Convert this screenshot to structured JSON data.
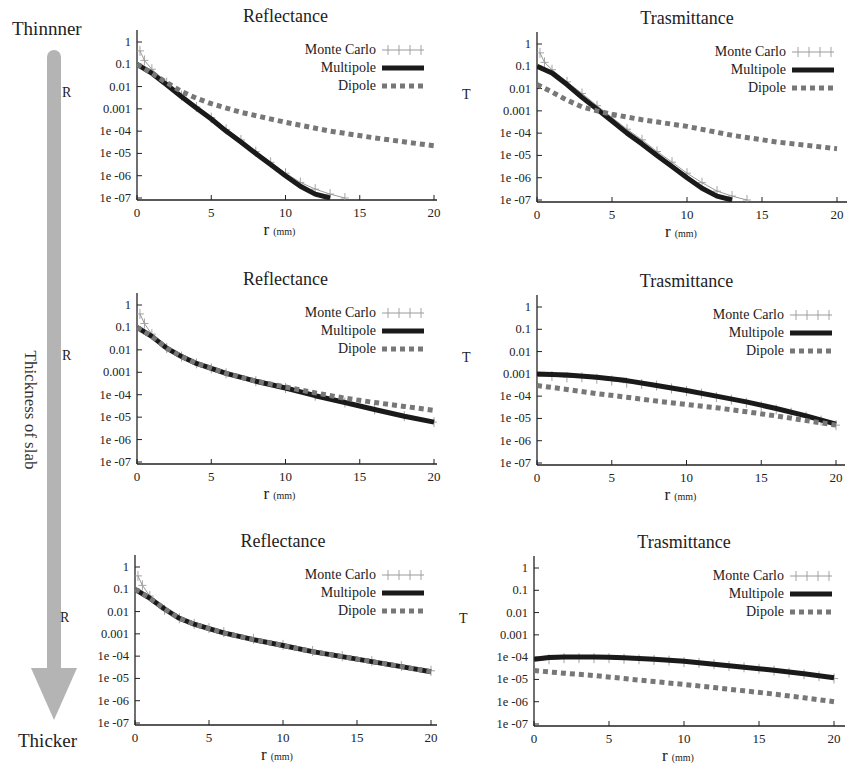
{
  "side_labels": {
    "top": "Thinnner",
    "middle": "Thickness of slab",
    "bottom": "Thicker"
  },
  "colors": {
    "monte_carlo": "#9a9a9a",
    "multipole": "#1a1a1a",
    "dipole": "#777777",
    "arrow": "#b4b4b4",
    "axis": "#222222"
  },
  "chart_data": [
    {
      "id": "r1-reflectance",
      "row": 1,
      "type": "line",
      "title": "Reflectance",
      "ylabel": "R",
      "xlabel": "r",
      "xlabel_unit": "(mm)",
      "xlim": [
        0,
        20
      ],
      "ylim": [
        1e-07,
        1
      ],
      "yscale": "log",
      "xticks": [
        "0",
        "5",
        "10",
        "15",
        "20"
      ],
      "yticks": [
        "1",
        "0.1",
        "0.01",
        "0.001",
        "1e -04",
        "1e -05",
        "1e -06",
        "1e -07"
      ],
      "legend": [
        "Monte Carlo",
        "Multipole",
        "Dipole"
      ],
      "legend_position": "upper right",
      "series": [
        {
          "name": "Monte Carlo",
          "x": [
            0.2,
            0.5,
            1,
            2,
            3,
            4,
            5,
            6,
            7,
            8,
            9,
            10,
            11,
            12,
            13,
            14
          ],
          "y": [
            0.4,
            0.15,
            0.06,
            0.015,
            0.004,
            0.0012,
            0.0004,
            0.00012,
            4e-05,
            1.2e-05,
            4e-06,
            1.3e-06,
            5e-07,
            2.5e-07,
            1.5e-07,
            1e-07
          ]
        },
        {
          "name": "Multipole",
          "x": [
            0,
            1,
            2,
            3,
            4,
            5,
            6,
            7,
            8,
            9,
            10,
            11,
            12,
            13
          ],
          "y": [
            0.1,
            0.04,
            0.012,
            0.0035,
            0.0011,
            0.00035,
            0.0001,
            3.3e-05,
            1e-05,
            3.2e-06,
            1e-06,
            3.4e-07,
            1.5e-07,
            1e-07
          ]
        },
        {
          "name": "Dipole",
          "x": [
            0,
            1,
            2,
            3,
            4,
            5,
            7,
            10,
            13,
            16,
            20
          ],
          "y": [
            0.1,
            0.04,
            0.015,
            0.006,
            0.003,
            0.0017,
            0.0007,
            0.00025,
            0.0001,
            5e-05,
            2.2e-05
          ]
        }
      ]
    },
    {
      "id": "r1-trasmittance",
      "row": 1,
      "type": "line",
      "title": "Trasmittance",
      "ylabel": "T",
      "xlabel": "r",
      "xlabel_unit": "(mm)",
      "xlim": [
        0,
        20
      ],
      "ylim": [
        1e-07,
        1
      ],
      "yscale": "log",
      "xticks": [
        "0",
        "5",
        "10",
        "15",
        "20"
      ],
      "yticks": [
        "1",
        "0.1",
        "0.01",
        "0.001",
        "1e -04",
        "1e -05",
        "1e -06",
        "1e -07"
      ],
      "legend": [
        "Monte Carlo",
        "Multipole",
        "Dipole"
      ],
      "legend_position": "upper right",
      "series": [
        {
          "name": "Monte Carlo",
          "x": [
            0.2,
            0.5,
            1,
            2,
            3,
            4,
            5,
            6,
            7,
            8,
            9,
            10,
            11,
            12,
            13,
            14
          ],
          "y": [
            0.4,
            0.15,
            0.07,
            0.02,
            0.006,
            0.0017,
            0.0005,
            0.00015,
            5e-05,
            1.5e-05,
            5e-06,
            1.6e-06,
            6e-07,
            2.5e-07,
            1.5e-07,
            1e-07
          ]
        },
        {
          "name": "Multipole",
          "x": [
            0,
            1,
            2,
            3,
            4,
            5,
            6,
            7,
            8,
            9,
            10,
            11,
            12,
            13
          ],
          "y": [
            0.1,
            0.05,
            0.015,
            0.004,
            0.0012,
            0.00035,
            0.0001,
            3.3e-05,
            1e-05,
            3.2e-06,
            1e-06,
            3.4e-07,
            1.5e-07,
            1e-07
          ]
        },
        {
          "name": "Dipole",
          "x": [
            0,
            1,
            2,
            3,
            4,
            5,
            7,
            10,
            13,
            16,
            20
          ],
          "y": [
            0.015,
            0.007,
            0.003,
            0.0015,
            0.001,
            0.0007,
            0.0004,
            0.0002,
            8e-05,
            4e-05,
            2e-05
          ]
        }
      ]
    },
    {
      "id": "r2-reflectance",
      "row": 2,
      "type": "line",
      "title": "Reflectance",
      "ylabel": "R",
      "xlabel": "r",
      "xlabel_unit": "(mm)",
      "xlim": [
        0,
        20
      ],
      "ylim": [
        1e-07,
        1
      ],
      "yscale": "log",
      "xticks": [
        "0",
        "5",
        "10",
        "15",
        "20"
      ],
      "yticks": [
        "1",
        "0.1",
        "0.01",
        "0.001",
        "1e -04",
        "1e -05",
        "1e -06",
        "1e -07"
      ],
      "legend": [
        "Monte Carlo",
        "Multipole",
        "Dipole"
      ],
      "legend_position": "upper right",
      "series": [
        {
          "name": "Monte Carlo",
          "x": [
            0.2,
            0.5,
            1,
            2,
            3,
            4,
            5,
            6,
            8,
            10,
            12,
            14,
            16,
            18,
            20
          ],
          "y": [
            0.4,
            0.15,
            0.05,
            0.012,
            0.005,
            0.0025,
            0.0015,
            0.0009,
            0.0004,
            0.0002,
            9e-05,
            4.5e-05,
            2.2e-05,
            1.1e-05,
            6e-06
          ]
        },
        {
          "name": "Multipole",
          "x": [
            0,
            1,
            2,
            3,
            4,
            5,
            6,
            8,
            10,
            12,
            14,
            16,
            18,
            20
          ],
          "y": [
            0.1,
            0.04,
            0.012,
            0.005,
            0.0025,
            0.0015,
            0.0009,
            0.0004,
            0.0002,
            9e-05,
            4.5e-05,
            2.2e-05,
            1.1e-05,
            6e-06
          ]
        },
        {
          "name": "Dipole",
          "x": [
            0,
            1,
            2,
            3,
            4,
            5,
            6,
            8,
            10,
            12,
            14,
            16,
            18,
            20
          ],
          "y": [
            0.1,
            0.04,
            0.012,
            0.005,
            0.0025,
            0.0015,
            0.0009,
            0.0004,
            0.00022,
            0.00012,
            7e-05,
            4.5e-05,
            3e-05,
            2e-05
          ]
        }
      ]
    },
    {
      "id": "r2-trasmittance",
      "row": 2,
      "type": "line",
      "title": "Trasmittance",
      "ylabel": "T",
      "xlabel": "r",
      "xlabel_unit": "(mm)",
      "xlim": [
        0,
        20
      ],
      "ylim": [
        1e-07,
        1
      ],
      "yscale": "log",
      "xticks": [
        "0",
        "5",
        "10",
        "15",
        "20"
      ],
      "yticks": [
        "1",
        "0.1",
        "0.01",
        "0.001",
        "1e -04",
        "1e -05",
        "1e -06",
        "1e -07"
      ],
      "legend": [
        "Monte Carlo",
        "Multipole",
        "Dipole"
      ],
      "legend_position": "upper right",
      "series": [
        {
          "name": "Monte Carlo",
          "x": [
            0,
            1,
            2,
            3,
            4,
            5,
            6,
            7,
            8,
            9,
            10,
            11,
            12,
            13,
            14,
            15,
            16,
            17,
            18,
            19,
            20
          ],
          "y": [
            0.0008,
            0.0008,
            0.0007,
            0.0007,
            0.0006,
            0.0005,
            0.0004,
            0.00035,
            0.0003,
            0.00022,
            0.00017,
            0.00013,
            9e-05,
            7e-05,
            5e-05,
            3.5e-05,
            2.5e-05,
            1.8e-05,
            1.2e-05,
            8e-06,
            5e-06
          ]
        },
        {
          "name": "Multipole",
          "x": [
            0,
            2,
            4,
            6,
            8,
            10,
            12,
            14,
            16,
            18,
            20
          ],
          "y": [
            0.001,
            0.0009,
            0.0007,
            0.0005,
            0.0003,
            0.00018,
            0.0001,
            5.5e-05,
            2.8e-05,
            1.3e-05,
            5.5e-06
          ]
        },
        {
          "name": "Dipole",
          "x": [
            0,
            2,
            4,
            6,
            8,
            10,
            12,
            14,
            16,
            18,
            20
          ],
          "y": [
            0.0003,
            0.0002,
            0.00013,
            9e-05,
            6e-05,
            4.2e-05,
            3e-05,
            2e-05,
            1.3e-05,
            8e-06,
            5e-06
          ]
        }
      ]
    },
    {
      "id": "r3-reflectance",
      "row": 3,
      "type": "line",
      "title": "Reflectance",
      "ylabel": "R",
      "xlabel": "r",
      "xlabel_unit": "(mm)",
      "xlim": [
        0,
        20
      ],
      "ylim": [
        1e-07,
        1
      ],
      "yscale": "log",
      "xticks": [
        "0",
        "5",
        "10",
        "15",
        "20"
      ],
      "yticks": [
        "1",
        "0.1",
        "0.01",
        "0.001",
        "1e -04",
        "1e -05",
        "1e -06",
        "1e -07"
      ],
      "legend": [
        "Monte Carlo",
        "Multipole",
        "Dipole"
      ],
      "legend_position": "upper right",
      "series": [
        {
          "name": "Monte Carlo",
          "x": [
            0.2,
            0.5,
            1,
            2,
            3,
            4,
            5,
            6,
            8,
            10,
            12,
            14,
            16,
            18,
            20
          ],
          "y": [
            0.4,
            0.15,
            0.05,
            0.012,
            0.005,
            0.0028,
            0.0018,
            0.0012,
            0.0006,
            0.00032,
            0.00017,
            0.0001,
            6e-05,
            3.6e-05,
            2.2e-05
          ]
        },
        {
          "name": "Multipole",
          "x": [
            0,
            1,
            2,
            3,
            4,
            5,
            6,
            8,
            10,
            12,
            14,
            16,
            18,
            20
          ],
          "y": [
            0.1,
            0.04,
            0.013,
            0.005,
            0.0027,
            0.0017,
            0.0011,
            0.00055,
            0.0003,
            0.00016,
            9.5e-05,
            5.7e-05,
            3.4e-05,
            2e-05
          ]
        },
        {
          "name": "Dipole",
          "x": [
            0,
            1,
            2,
            3,
            4,
            5,
            6,
            8,
            10,
            12,
            14,
            16,
            18,
            20
          ],
          "y": [
            0.1,
            0.04,
            0.013,
            0.005,
            0.0027,
            0.0017,
            0.0011,
            0.00055,
            0.0003,
            0.00016,
            9.5e-05,
            5.7e-05,
            3.4e-05,
            2e-05
          ]
        }
      ]
    },
    {
      "id": "r3-trasmittance",
      "row": 3,
      "type": "line",
      "title": "Trasmittance",
      "ylabel": "T",
      "xlabel": "r",
      "xlabel_unit": "(mm)",
      "xlim": [
        0,
        20
      ],
      "ylim": [
        1e-07,
        1
      ],
      "yscale": "log",
      "xticks": [
        "0",
        "5",
        "10",
        "15",
        "20"
      ],
      "yticks": [
        "1",
        "0.1",
        "0.01",
        "0.001",
        "1e -04",
        "1e -05",
        "1e -06",
        "1e -07"
      ],
      "legend": [
        "Monte Carlo",
        "Multipole",
        "Dipole"
      ],
      "legend_position": "upper right",
      "series": [
        {
          "name": "Monte Carlo",
          "x": [
            0,
            1,
            2,
            3,
            4,
            5,
            6,
            7,
            8,
            9,
            10,
            11,
            12,
            13,
            14,
            15,
            16,
            17,
            18,
            19,
            20
          ],
          "y": [
            7e-05,
            8e-05,
            9e-05,
            9e-05,
            9e-05,
            9e-05,
            8.5e-05,
            8e-05,
            7.5e-05,
            7e-05,
            6e-05,
            5.5e-05,
            4.8e-05,
            4e-05,
            3.5e-05,
            3e-05,
            2.5e-05,
            2e-05,
            1.7e-05,
            1.4e-05,
            1.1e-05
          ]
        },
        {
          "name": "Multipole",
          "x": [
            0,
            1,
            2,
            3,
            4,
            5,
            6,
            8,
            10,
            12,
            14,
            16,
            18,
            20
          ],
          "y": [
            8e-05,
            9.5e-05,
            0.0001,
            0.0001,
            0.0001,
            9.8e-05,
            9.3e-05,
            8e-05,
            6.5e-05,
            4.8e-05,
            3.5e-05,
            2.6e-05,
            1.8e-05,
            1.2e-05
          ]
        },
        {
          "name": "Dipole",
          "x": [
            0,
            2,
            4,
            6,
            8,
            10,
            12,
            14,
            16,
            18,
            20
          ],
          "y": [
            2.5e-05,
            1.9e-05,
            1.5e-05,
            1.1e-05,
            8e-06,
            6e-06,
            4.3e-06,
            3.1e-06,
            2.2e-06,
            1.5e-06,
            1e-06
          ]
        }
      ]
    }
  ],
  "layout": {
    "panels": [
      {
        "x0": 137,
        "x20": 434,
        "y1": 42,
        "y7": 198,
        "xend": 437,
        "ytop": 30
      },
      {
        "x0": 537,
        "x20": 837,
        "y1": 44,
        "y7": 200,
        "xend": 847,
        "ytop": 32
      },
      {
        "x0": 137,
        "x20": 434,
        "y1": 305,
        "y7": 462,
        "xend": 437,
        "ytop": 293
      },
      {
        "x0": 537,
        "x20": 836,
        "y1": 307,
        "y7": 463,
        "xend": 845,
        "ytop": 295
      },
      {
        "x0": 135,
        "x20": 431,
        "y1": 567,
        "y7": 723,
        "xend": 437,
        "ytop": 555
      },
      {
        "x0": 534,
        "x20": 834,
        "y1": 568,
        "y7": 724,
        "xend": 845,
        "ytop": 556
      }
    ]
  }
}
